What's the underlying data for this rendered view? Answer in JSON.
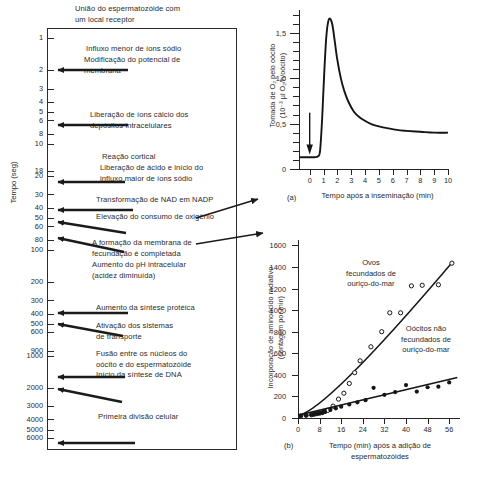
{
  "figure": {
    "heading": "União do espermatozóide com um local receptor",
    "heading_line1": "União do espermatozóide com",
    "heading_line2": "um local receptor"
  },
  "timeline": {
    "axis_title": "Tempo (seg)",
    "tick_values": [
      1,
      2,
      3,
      4,
      5,
      6,
      8,
      10,
      18,
      20,
      30,
      40,
      50,
      60,
      80,
      100,
      200,
      300,
      400,
      500,
      600,
      900,
      1000,
      2000,
      3000,
      4000,
      5000,
      6000
    ],
    "events": [
      {
        "text_lines": [
          "Influxo menor de íons sódio"
        ],
        "time": 1
      },
      {
        "text_lines": [
          "Modificação do potencial de",
          "membrana"
        ],
        "time": 2
      },
      {
        "text_lines": [
          "Liberação de íons cálcio dos",
          "depósitos intracelulares"
        ],
        "time": 8
      },
      {
        "text_lines": [
          "Reação cortical"
        ],
        "time": 18
      },
      {
        "text_lines": [
          "Liberação de ácido e início do",
          "influxo maior de íons sódio"
        ],
        "time": 20
      },
      {
        "text_lines": [
          "Transformação de NAD em NADP"
        ],
        "time": 30
      },
      {
        "text_lines": [
          "Elevação do consumo de oxigênio"
        ],
        "time": 40
      },
      {
        "text_lines": [
          "A formação da membrana de",
          "fecundação é completada"
        ],
        "time": 60
      },
      {
        "text_lines": [
          "Aumento do pH intracelular",
          "(acidez diminuída)"
        ],
        "time": 80
      },
      {
        "text_lines": [
          "Aumento da síntese protéica"
        ],
        "time": 300
      },
      {
        "text_lines": [
          "Ativação dos sistemas",
          "de transporte"
        ],
        "time": 400
      },
      {
        "text_lines": [
          "Fusão entre os núcleos do",
          "oócito e do espermatozóide"
        ],
        "time": 900
      },
      {
        "text_lines": [
          "Início da síntese de DNA"
        ],
        "time": 1500
      },
      {
        "text_lines": [
          "Primeira divisão celular"
        ],
        "time": 6000
      }
    ]
  },
  "chart_data": [
    {
      "id": "a",
      "type": "line",
      "panel_label": "(a)",
      "title": "",
      "xlabel": "Tempo após a inseminação (min)",
      "ylabel": "Tomada de O2 pelo oócito (10-3 µl O2/h/oócito)",
      "ylabel_line1": "Tomada de O₂ pelo oócito",
      "ylabel_line2": "(10⁻³ µl O₂/h/oócito)",
      "xlim": [
        -0.7,
        10
      ],
      "ylim": [
        0,
        1.75
      ],
      "xticks": [
        0,
        1,
        2,
        3,
        4,
        5,
        6,
        7,
        8,
        9,
        10
      ],
      "yticks": [
        0,
        0.5,
        1.0,
        1.5
      ],
      "ytick_labels": [
        "0",
        "0,5",
        "1,0",
        "1,5"
      ],
      "yticks_minor": [
        0.1,
        0.2,
        0.3,
        0.4,
        0.6,
        0.7,
        0.8,
        0.9,
        1.1,
        1.2,
        1.3,
        1.4,
        1.6,
        1.7
      ],
      "grid": false,
      "annotation_arrow_at_x": 0,
      "series": [
        {
          "name": "Tomada de O2",
          "x": [
            -0.7,
            -0.3,
            0.0,
            0.35,
            0.6,
            0.75,
            0.9,
            1.05,
            1.2,
            1.35,
            1.5,
            1.65,
            1.8,
            2.0,
            2.25,
            2.5,
            2.8,
            3.2,
            3.6,
            4.0,
            4.5,
            5.0,
            5.6,
            6.3,
            7.0,
            8.0,
            9.0,
            10.0
          ],
          "y": [
            0.13,
            0.13,
            0.13,
            0.13,
            0.14,
            0.2,
            0.55,
            1.05,
            1.45,
            1.63,
            1.65,
            1.58,
            1.42,
            1.2,
            1.0,
            0.86,
            0.74,
            0.63,
            0.57,
            0.53,
            0.49,
            0.47,
            0.45,
            0.43,
            0.42,
            0.41,
            0.4,
            0.4
          ]
        }
      ]
    },
    {
      "id": "b",
      "type": "scatter",
      "panel_label": "(b)",
      "title": "",
      "xlabel": "Tempo (min) após a adição de espermatozóides",
      "xlabel_line1": "Tempo (min) após a adição de",
      "xlabel_line2": "espermatozóides",
      "ylabel": "Incorporação de aminoácido radiativo (contagem por min)",
      "ylabel_line1": "Incorporação de aminoácido radiativo",
      "ylabel_line2": "(contagem por min)",
      "xlim": [
        0,
        60
      ],
      "ylim": [
        0,
        1650
      ],
      "xticks": [
        0,
        8,
        16,
        24,
        32,
        40,
        48,
        56
      ],
      "yticks": [
        0,
        200,
        400,
        600,
        800,
        1000,
        1200,
        1400,
        1600
      ],
      "grid": false,
      "series": [
        {
          "name": "Ovos fecundados de ouriço-do-mar",
          "label_lines": [
            "Ovos",
            "fecundados de",
            "ouriço-do-mar"
          ],
          "marker": "open-circle",
          "x": [
            1,
            3,
            5,
            6,
            7,
            8,
            9,
            10,
            11,
            13,
            15,
            17,
            19,
            21,
            23,
            27,
            31,
            34,
            38,
            42,
            46,
            52,
            57
          ],
          "y": [
            20,
            25,
            30,
            35,
            40,
            45,
            50,
            60,
            70,
            110,
            175,
            230,
            320,
            420,
            530,
            660,
            800,
            975,
            975,
            1225,
            1230,
            1235,
            1435
          ],
          "fit_line": {
            "x": [
              8,
              57
            ],
            "y": [
              45,
              1440
            ]
          }
        },
        {
          "name": "Oócitos não fecundados de ouriço-do-mar",
          "label_lines": [
            "Oócitos não",
            "fecundados de",
            "ouriço-do-mar"
          ],
          "marker": "filled-circle",
          "x": [
            1,
            3,
            5,
            6,
            7,
            8,
            9,
            10,
            12,
            14,
            16,
            19,
            22,
            25,
            28,
            32,
            36,
            40,
            44,
            48,
            52,
            56
          ],
          "y": [
            20,
            25,
            30,
            35,
            40,
            45,
            50,
            60,
            75,
            90,
            105,
            125,
            145,
            165,
            280,
            215,
            240,
            305,
            245,
            285,
            290,
            330
          ],
          "fit_line": {
            "x": [
              0,
              59
            ],
            "y": [
              25,
              375
            ]
          }
        }
      ]
    }
  ]
}
